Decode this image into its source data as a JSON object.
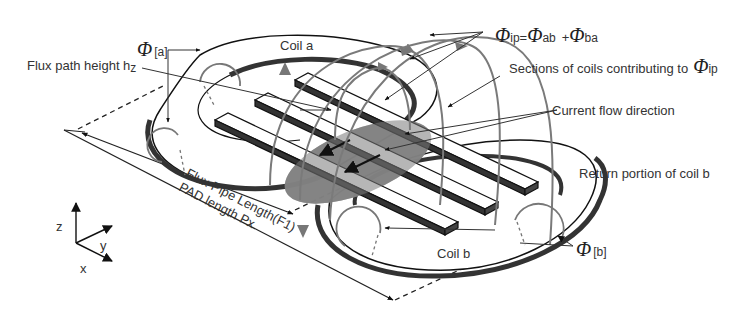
{
  "figure": {
    "type": "bipolar DD coil pad with ferrite bars, flux path illustration",
    "colors": {
      "background": "#ffffff",
      "coil_fill": "#ffffff",
      "coil_edge": "#111111",
      "coil_side": "#333333",
      "flux_arc": "#808080",
      "flux_ellipse": "#8a8a8a",
      "text": "#333333"
    }
  },
  "labels": {
    "phi_a": {
      "symbol": "Φ",
      "subscript": "[a]"
    },
    "phi_b": {
      "symbol": "Φ",
      "subscript": "[b]"
    },
    "flux_height": "Flux path height h",
    "flux_height_sub": "z",
    "coil_a": "Coil a",
    "coil_b": "Coil b",
    "phi_ip_equation": {
      "lhs_symbol": "Φ",
      "lhs_sub": "ip",
      "eq": "=",
      "t1_symbol": "Φ",
      "t1_sub": "ab",
      "plus": "+",
      "t2_symbol": "Φ",
      "t2_sub": "ba"
    },
    "sections_contrib": "Sections of coils contributing to",
    "sections_phi": {
      "symbol": "Φ",
      "subscript": "ip"
    },
    "current_flow": "Current flow direction",
    "return_portion": "Return portion of coil b",
    "flux_pipe_length": "Flux Pipe Length(F1)",
    "pad_length": "PAD length Px"
  },
  "axes": {
    "z": "z",
    "y": "y",
    "x": "x"
  }
}
